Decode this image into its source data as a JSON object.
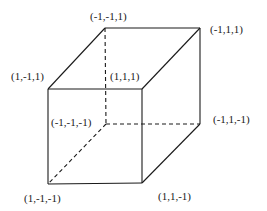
{
  "diagram": {
    "vertices": [
      {
        "id": "v_m1_m1_1",
        "label": "(-1,-1,1)",
        "x": 105,
        "y": 28,
        "label_x": 90,
        "label_y": 11
      },
      {
        "id": "v_m1_1_1",
        "label": "(-1,1,1)",
        "x": 200,
        "y": 28,
        "label_x": 210,
        "label_y": 24
      },
      {
        "id": "v_1_m1_1",
        "label": "(1,-1,1)",
        "x": 48,
        "y": 89,
        "label_x": 11,
        "label_y": 71
      },
      {
        "id": "v_1_1_1",
        "label": "(1,1,1)",
        "x": 142,
        "y": 89,
        "label_x": 110,
        "label_y": 71
      },
      {
        "id": "v_m1_m1_m1",
        "label": "(-1,-1,-1)",
        "x": 106,
        "y": 124,
        "label_x": 51,
        "label_y": 117
      },
      {
        "id": "v_m1_1_m1",
        "label": "(-1,1,-1)",
        "x": 200,
        "y": 124,
        "label_x": 213,
        "label_y": 114
      },
      {
        "id": "v_1_m1_m1",
        "label": "(1,-1,-1)",
        "x": 48,
        "y": 184,
        "label_x": 24,
        "label_y": 193
      },
      {
        "id": "v_1_1_m1",
        "label": "(1,1,-1)",
        "x": 142,
        "y": 183,
        "label_x": 158,
        "label_y": 191
      }
    ],
    "edges": [
      {
        "from": "v_1_m1_1",
        "to": "v_1_1_1",
        "style": "solid"
      },
      {
        "from": "v_1_1_1",
        "to": "v_1_1_m1",
        "style": "solid"
      },
      {
        "from": "v_1_1_m1",
        "to": "v_1_m1_m1",
        "style": "solid"
      },
      {
        "from": "v_1_m1_m1",
        "to": "v_1_m1_1",
        "style": "solid"
      },
      {
        "from": "v_1_m1_1",
        "to": "v_m1_m1_1",
        "style": "solid"
      },
      {
        "from": "v_m1_m1_1",
        "to": "v_m1_1_1",
        "style": "solid"
      },
      {
        "from": "v_m1_1_1",
        "to": "v_1_1_1",
        "style": "solid"
      },
      {
        "from": "v_m1_1_1",
        "to": "v_m1_1_m1",
        "style": "solid"
      },
      {
        "from": "v_m1_1_m1",
        "to": "v_1_1_m1",
        "style": "solid"
      },
      {
        "from": "v_m1_m1_1",
        "to": "v_m1_m1_m1",
        "style": "dashed"
      },
      {
        "from": "v_m1_m1_m1",
        "to": "v_m1_1_m1",
        "style": "dashed"
      },
      {
        "from": "v_m1_m1_m1",
        "to": "v_1_m1_m1",
        "style": "dashed"
      }
    ],
    "colors": {
      "line": "#1a1a1a",
      "background": "#ffffff"
    }
  }
}
